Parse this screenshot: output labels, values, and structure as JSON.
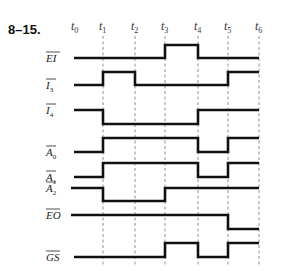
{
  "figure": {
    "number": "8–15.",
    "type": "timing-diagram"
  },
  "time_marks": [
    {
      "label": "t",
      "sub": "0",
      "x": 75
    },
    {
      "label": "t",
      "sub": "1",
      "x": 103
    },
    {
      "label": "t",
      "sub": "2",
      "x": 135
    },
    {
      "label": "t",
      "sub": "3",
      "x": 165
    },
    {
      "label": "t",
      "sub": "4",
      "x": 198
    },
    {
      "label": "t",
      "sub": "5",
      "x": 228
    },
    {
      "label": "t",
      "sub": "6",
      "x": 259
    }
  ],
  "signals": [
    {
      "name": "EI",
      "sub": "",
      "active_low": true,
      "high_y": 45,
      "low_y": 58,
      "start_x": 74,
      "initial": 0,
      "transitions": [
        {
          "at": "t3",
          "to": 1
        },
        {
          "at": "t4",
          "to": 0
        }
      ]
    },
    {
      "name": "I",
      "sub": "3",
      "active_low": true,
      "high_y": 72,
      "low_y": 85,
      "start_x": 74,
      "initial": 0,
      "transitions": [
        {
          "at": "t1",
          "to": 1
        },
        {
          "at": "t2",
          "to": 0
        },
        {
          "at": "t5",
          "to": 1
        }
      ]
    },
    {
      "name": "I",
      "sub": "4",
      "active_low": true,
      "high_y": 110,
      "low_y": 124,
      "start_x": 74,
      "initial": 1,
      "transitions": [
        {
          "at": "t1",
          "to": 0
        },
        {
          "at": "t4",
          "to": 1
        }
      ]
    },
    {
      "name": "A",
      "sub": "0",
      "active_low": true,
      "high_y": 138,
      "low_y": 152,
      "start_x": 74,
      "initial": 0,
      "transitions": [
        {
          "at": "t1",
          "to": 1
        },
        {
          "at": "t4",
          "to": 0
        },
        {
          "at": "t5",
          "to": 1
        }
      ]
    },
    {
      "name": "A",
      "sub": "1",
      "active_low": true,
      "high_y": 163,
      "low_y": 177,
      "start_x": 74,
      "initial": 0,
      "transitions": [
        {
          "at": "t1",
          "to": 1
        },
        {
          "at": "t4",
          "to": 0
        },
        {
          "at": "t5",
          "to": 1
        }
      ]
    },
    {
      "name": "A",
      "sub": "2",
      "active_low": true,
      "high_y": 188,
      "low_y": 201,
      "start_x": 71,
      "initial": 1,
      "transitions": [
        {
          "at": "t1",
          "to": 0
        },
        {
          "at": "t3",
          "to": 1
        }
      ]
    },
    {
      "name": "EO",
      "sub": "",
      "active_low": true,
      "high_y": 215,
      "low_y": 229,
      "start_x": 71,
      "initial": 1,
      "transitions": [
        {
          "at": "t5",
          "to": 0
        }
      ]
    },
    {
      "name": "GS",
      "sub": "",
      "active_low": true,
      "high_y": 243,
      "low_y": 257,
      "start_x": 74,
      "initial": 0,
      "transitions": [
        {
          "at": "t3",
          "to": 1
        },
        {
          "at": "t4",
          "to": 0
        },
        {
          "at": "t5",
          "to": 1
        }
      ]
    }
  ],
  "grid": {
    "top_y": 36,
    "bottom_y": 266,
    "dashed": true,
    "marks_with_lines": [
      "t1",
      "t2",
      "t3",
      "t4",
      "t5",
      "t6"
    ]
  }
}
